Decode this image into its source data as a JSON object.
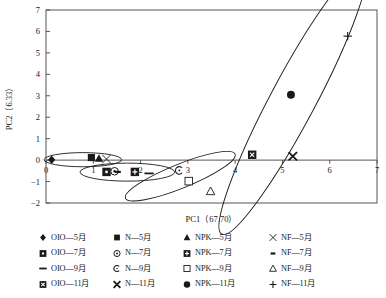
{
  "chart_data": {
    "type": "scatter",
    "title": "",
    "xlabel": "PC1（67.70）",
    "ylabel": "PC2（6.33）",
    "xlim": [
      0,
      7
    ],
    "ylim": [
      -2,
      7
    ],
    "xticks": [
      0,
      1,
      2,
      3,
      4,
      5,
      6,
      7
    ],
    "xtick_labels": [
      "0",
      "1",
      "2",
      "3",
      "4",
      "5",
      "6",
      "7"
    ],
    "yticks": [
      -2,
      -1,
      0,
      1,
      2,
      3,
      4,
      5,
      6,
      7
    ],
    "ytick_labels": [
      "−2",
      "−1",
      "0",
      "1",
      "2",
      "3",
      "4",
      "5",
      "6",
      "7"
    ],
    "grid": false,
    "legend_position": "below",
    "points": [
      {
        "name": "OIO—5月",
        "marker": "filled-diamond",
        "x": 0.12,
        "y": 0.02
      },
      {
        "name": "OIO—7月",
        "marker": "filled-square-dot",
        "x": 1.28,
        "y": -0.55
      },
      {
        "name": "OIO—9月",
        "marker": "dash",
        "x": 2.18,
        "y": -0.62
      },
      {
        "name": "OIO—11月",
        "marker": "filled-square-x",
        "x": 4.36,
        "y": 0.25
      },
      {
        "name": "N—5月",
        "marker": "filled-square",
        "x": 0.96,
        "y": 0.12
      },
      {
        "name": "N—7月",
        "marker": "open-circle-dot",
        "x": 1.45,
        "y": -0.52
      },
      {
        "name": "N—9月",
        "marker": "open-circle-c",
        "x": 2.82,
        "y": -0.48
      },
      {
        "name": "N—11月",
        "marker": "bold-x",
        "x": 5.22,
        "y": 0.18
      },
      {
        "name": "NPK—5月",
        "marker": "filled-triangle",
        "x": 1.12,
        "y": 0.08
      },
      {
        "name": "NPK—7月",
        "marker": "square-plus",
        "x": 1.88,
        "y": -0.55
      },
      {
        "name": "NPK—9月",
        "marker": "open-square",
        "x": 3.02,
        "y": -0.98
      },
      {
        "name": "NPK—11月",
        "marker": "filled-circle",
        "x": 5.18,
        "y": 3.05
      },
      {
        "name": "NF—5月",
        "marker": "cross-x",
        "x": 1.28,
        "y": 0.05
      },
      {
        "name": "NF—7月",
        "marker": "small-dash",
        "x": 1.52,
        "y": -0.55
      },
      {
        "name": "NF—9月",
        "marker": "open-triangle",
        "x": 3.48,
        "y": -1.45
      },
      {
        "name": "NF—11月",
        "marker": "plus",
        "x": 6.38,
        "y": 5.78
      }
    ],
    "ellipses": [
      {
        "name": "cluster-5yue",
        "cx": 0.78,
        "cy": 0.02,
        "rx": 0.82,
        "ry": 0.33,
        "angle": 0
      },
      {
        "name": "cluster-7yue",
        "cx": 1.72,
        "cy": -0.56,
        "rx": 1.0,
        "ry": 0.42,
        "angle": 0
      },
      {
        "name": "cluster-9yue",
        "cx": 2.84,
        "cy": -0.75,
        "rx": 1.25,
        "ry": 0.56,
        "angle": -22
      },
      {
        "name": "cluster-11yue",
        "cx": 5.22,
        "cy": 2.78,
        "rx": 3.2,
        "ry": 1.05,
        "angle": -62
      }
    ]
  },
  "legend": {
    "rows": [
      [
        {
          "marker": "filled-diamond",
          "label": "OIO—5月"
        },
        {
          "marker": "filled-square",
          "label": "N—5月"
        },
        {
          "marker": "filled-triangle",
          "label": "NPK—5月"
        },
        {
          "marker": "cross-x",
          "label": "NF—5月"
        }
      ],
      [
        {
          "marker": "filled-square-dot",
          "label": "OIO—7月"
        },
        {
          "marker": "open-circle-dot",
          "label": "N—7月"
        },
        {
          "marker": "square-plus",
          "label": "NPK—7月"
        },
        {
          "marker": "small-dash",
          "label": "NF—7月"
        }
      ],
      [
        {
          "marker": "dash",
          "label": "OIO—9月"
        },
        {
          "marker": "open-circle-c",
          "label": "N—9月"
        },
        {
          "marker": "open-square",
          "label": "NPK—9月"
        },
        {
          "marker": "open-triangle",
          "label": "NF—9月"
        }
      ],
      [
        {
          "marker": "filled-square-x",
          "label": "OIO—11月"
        },
        {
          "marker": "bold-x",
          "label": "N—11月"
        },
        {
          "marker": "filled-circle",
          "label": "NPK—11月"
        },
        {
          "marker": "plus",
          "label": "NF—11月"
        }
      ]
    ]
  },
  "colors": {
    "ink": "#1a1a1a",
    "axis": "#555555",
    "background": "#ffffff"
  }
}
